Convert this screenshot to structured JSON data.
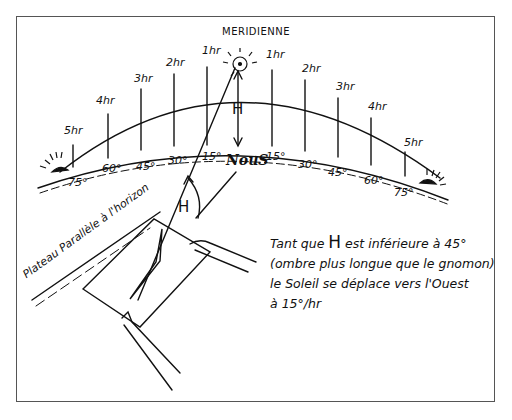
{
  "diagram": {
    "title": "MERIDIENNE",
    "center_label": "NouS",
    "angle_symbol": "H",
    "hour_labels_left": [
      "5hr",
      "4hr",
      "3hr",
      "2hr",
      "1hr"
    ],
    "hour_labels_right": [
      "1hr",
      "2hr",
      "3hr",
      "4hr",
      "5hr"
    ],
    "degree_labels_left": [
      "75°",
      "60°",
      "45°",
      "30°",
      "15°"
    ],
    "degree_labels_right": [
      "15°",
      "30°",
      "45°",
      "60°",
      "75°"
    ],
    "plateau_label": "Plateau Parallèle à l'horizon",
    "note": {
      "line1_pre": "Tant que ",
      "line1_H": "H",
      "line1_post": " est inférieure à 45°",
      "line2": "(ombre plus longue que le gnomon)",
      "line3": "le Soleil se déplace vers l'Ouest",
      "line4": "à 15°/hr"
    },
    "colors": {
      "ink": "#111111",
      "frame": "#555555",
      "background": "#ffffff"
    }
  }
}
